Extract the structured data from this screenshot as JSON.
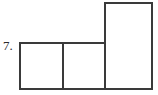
{
  "page": {
    "width": 158,
    "height": 95,
    "background_color": "#ffffff"
  },
  "problem": {
    "number_label": "7."
  },
  "figure": {
    "name": "composite-rectangle-figure",
    "stroke_color": "#3a3a3a",
    "fill_color": "#ffffff",
    "stroke_width": 2,
    "parts": [
      {
        "name": "left-square",
        "x": 20,
        "y": 43,
        "width": 43,
        "height": 46
      },
      {
        "name": "middle-square",
        "x": 63,
        "y": 43,
        "width": 42,
        "height": 46
      },
      {
        "name": "tall-rectangle",
        "x": 105,
        "y": 3,
        "width": 47,
        "height": 86
      }
    ],
    "outline_path": "M 20 43 L 105 43 L 105 3 L 152 3 L 152 89 L 20 89 Z",
    "interior_divider_paths": [
      "M 63 43 L 63 89",
      "M 105 43 L 105 89"
    ]
  }
}
